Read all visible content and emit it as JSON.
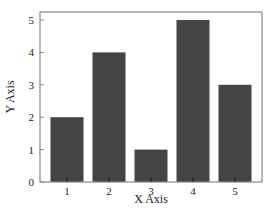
{
  "chart_data": {
    "type": "bar",
    "title": "",
    "xlabel": "X Axis",
    "ylabel": "Y Axis",
    "categories": [
      "1",
      "2",
      "3",
      "4",
      "5"
    ],
    "values": [
      2,
      4,
      1,
      5,
      3
    ],
    "ylim": [
      0,
      5
    ],
    "yticks": [
      0,
      1,
      2,
      3,
      4,
      5
    ],
    "grid": false,
    "legend": null,
    "bar_color": "#444444",
    "frame_color": "#888888"
  }
}
